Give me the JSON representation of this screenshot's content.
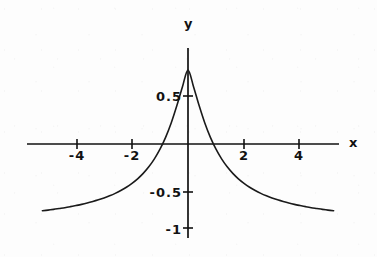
{
  "chart_data": {
    "type": "line",
    "title": "",
    "xlabel": "x",
    "ylabel": "y",
    "xlim": [
      -5.2,
      5.2
    ],
    "ylim": [
      -1.05,
      0.92
    ],
    "grid": false,
    "legend": null,
    "axis_style": "centered-cross",
    "xticks": [
      -4,
      -2,
      2,
      4
    ],
    "xtick_labels": [
      "-4",
      "-2",
      "2",
      "4"
    ],
    "yticks": [
      0.5,
      -0.5,
      -1
    ],
    "ytick_labels": [
      "0.5",
      "-0.5",
      "-1"
    ],
    "series": [
      {
        "name": "curve",
        "x": [
          -5.2,
          -5.0,
          -4.8,
          -4.6,
          -4.4,
          -4.2,
          -4.0,
          -3.8,
          -3.6,
          -3.4,
          -3.2,
          -3.0,
          -2.8,
          -2.6,
          -2.4,
          -2.2,
          -2.0,
          -1.8,
          -1.6,
          -1.4,
          -1.2,
          -1.0,
          -0.8,
          -0.6,
          -0.4,
          -0.2,
          0.0,
          0.2,
          0.4,
          0.6,
          0.8,
          1.0,
          1.2,
          1.4,
          1.6,
          1.8,
          2.0,
          2.2,
          2.4,
          2.6,
          2.8,
          3.0,
          3.2,
          3.4,
          3.6,
          3.8,
          4.0,
          4.2,
          4.4,
          4.6,
          4.8,
          5.0,
          5.2
        ],
        "y": [
          0.795,
          0.787,
          0.778,
          0.768,
          0.758,
          0.746,
          0.733,
          0.719,
          0.703,
          0.685,
          0.665,
          0.643,
          0.617,
          0.588,
          0.554,
          0.515,
          0.469,
          0.415,
          0.35,
          0.272,
          0.177,
          0.062,
          -0.079,
          -0.25,
          -0.454,
          -0.679,
          -0.88,
          -0.679,
          -0.454,
          -0.25,
          -0.079,
          0.062,
          0.177,
          0.272,
          0.35,
          0.415,
          0.469,
          0.515,
          0.554,
          0.588,
          0.617,
          0.643,
          0.665,
          0.685,
          0.703,
          0.719,
          0.733,
          0.746,
          0.758,
          0.768,
          0.778,
          0.787,
          0.795
        ],
        "minimum": {
          "x": 0,
          "y": -1
        },
        "zero_crossings": [
          -1.2,
          1.2
        ],
        "asymptote_y": 0.8,
        "color": "#1a1a1a",
        "width": 1.6
      }
    ],
    "colors": {
      "curve": "#1a1a1a",
      "axis": "#111111",
      "text": "#121212",
      "background": "#fdfdfd"
    }
  },
  "labels": {
    "y_axis": "y",
    "x_axis": "x",
    "tick_x_neg4": "-4",
    "tick_x_neg2": "-2",
    "tick_x_pos2": "2",
    "tick_x_pos4": "4",
    "tick_y_half": "0.5",
    "tick_y_neg_half": "-0.5",
    "tick_y_neg_one": "-1"
  }
}
